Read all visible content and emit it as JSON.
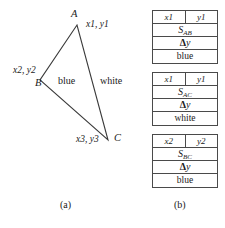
{
  "figure": {
    "panel_a": {
      "caption": "(a)",
      "vertices": [
        {
          "name": "A",
          "coord_label": "x1, y1",
          "x": 77,
          "y": 25
        },
        {
          "name": "B",
          "coord_label": "x2, y2",
          "x": 40,
          "y": 80
        },
        {
          "name": "C",
          "coord_label": "x3, y3",
          "x": 108,
          "y": 140
        }
      ],
      "edges": [
        {
          "id": "AB",
          "from": "A",
          "to": "B",
          "label": "blue"
        },
        {
          "id": "AC",
          "from": "A",
          "to": "C",
          "label": "white"
        },
        {
          "id": "BC",
          "from": "B",
          "to": "C",
          "label": ""
        }
      ]
    },
    "panel_b": {
      "caption": "(b)",
      "tables": [
        {
          "id": "record-ab",
          "row_coords": {
            "x": "x1",
            "y": "y1"
          },
          "row_slope": {
            "symbol": "S",
            "subscript": "AB"
          },
          "row_delta": {
            "glyph": "Δ",
            "var": "y"
          },
          "row_color": "blue"
        },
        {
          "id": "record-ac",
          "row_coords": {
            "x": "x1",
            "y": "y1"
          },
          "row_slope": {
            "symbol": "S",
            "subscript": "AC"
          },
          "row_delta": {
            "glyph": "Δ",
            "var": "y"
          },
          "row_color": "white"
        },
        {
          "id": "record-bc",
          "row_coords": {
            "x": "x2",
            "y": "y2"
          },
          "row_slope": {
            "symbol": "S",
            "subscript": "BC"
          },
          "row_delta": {
            "glyph": "Δ",
            "var": "y"
          },
          "row_color": "blue"
        }
      ]
    }
  },
  "colors": {
    "line": "#3a3a3a",
    "border": "#4a4a4a",
    "text": "#1a1a1a",
    "background": "#ffffff"
  }
}
